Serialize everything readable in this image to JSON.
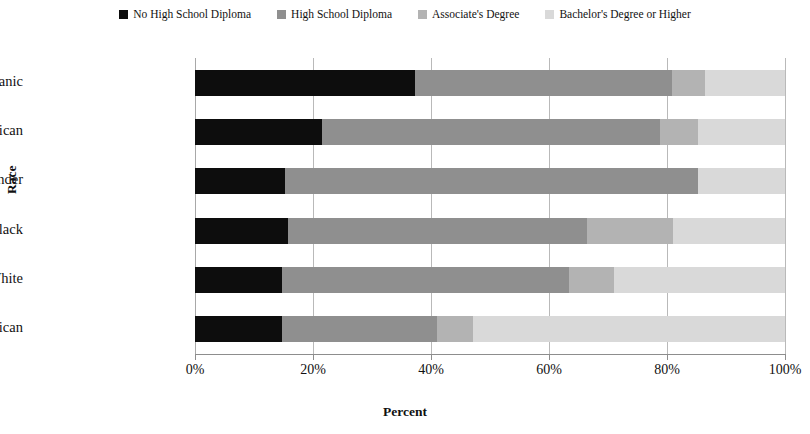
{
  "chart_data": {
    "type": "bar",
    "subtype": "horizontal-100-percent-stacked",
    "title": "",
    "xlabel": "Percent",
    "ylabel": "Race",
    "categories": [
      "Hispanic",
      "Native American",
      "Pacific Islander",
      "Black",
      "White",
      "Asian American"
    ],
    "xlim": [
      0,
      100
    ],
    "xticks": [
      0,
      20,
      40,
      60,
      80,
      100
    ],
    "xtick_labels": [
      "0%",
      "20%",
      "40%",
      "60%",
      "80%",
      "100%"
    ],
    "grid": true,
    "grid_axis": "x",
    "legend_position": "top",
    "series": [
      {
        "name": "No High School Diploma",
        "color": "#0d0d0d",
        "values": [
          37.3,
          21.5,
          15.3,
          15.8,
          14.7,
          14.7
        ]
      },
      {
        "name": "High School Diploma",
        "color": "#8f8f8f",
        "values": [
          43.5,
          57.3,
          70.0,
          50.6,
          48.7,
          26.4
        ]
      },
      {
        "name": "Associate's Degree",
        "color": "#b3b3b3",
        "values": [
          5.6,
          6.4,
          0.0,
          14.7,
          7.6,
          6.0
        ]
      },
      {
        "name": "Bachelor's Degree or Higher",
        "color": "#d9d9d9",
        "values": [
          13.6,
          14.8,
          14.7,
          18.9,
          29.0,
          52.9
        ]
      }
    ]
  },
  "legend": {
    "items": [
      {
        "label": "No High School Diploma",
        "color": "#0d0d0d"
      },
      {
        "label": "High School Diploma",
        "color": "#8f8f8f"
      },
      {
        "label": "Associate's Degree",
        "color": "#b3b3b3"
      },
      {
        "label": "Bachelor's Degree or Higher",
        "color": "#d9d9d9"
      }
    ]
  },
  "axes": {
    "x_title": "Percent",
    "y_title": "Race",
    "x_tick_labels": [
      "0%",
      "20%",
      "40%",
      "60%",
      "80%",
      "100%"
    ],
    "y_tick_labels": [
      "Hispanic",
      "Native American",
      "Pacific Islander",
      "Black",
      "White",
      "Asian American"
    ]
  }
}
